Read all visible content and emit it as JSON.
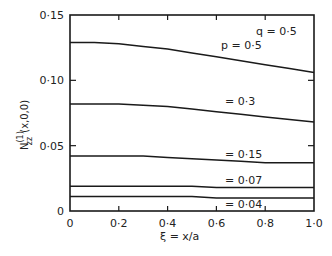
{
  "chart_data": {
    "type": "line",
    "title": "",
    "xlabel": "ξ = x/a",
    "ylabel": "N(1)zz (x,0,0)",
    "xlim": [
      0,
      1.0
    ],
    "ylim": [
      0,
      0.15
    ],
    "grid": false,
    "legend": "inline annotations",
    "x_ticks": [
      "0",
      "0·2",
      "0·4",
      "0·6",
      "0·8",
      "1·0"
    ],
    "y_ticks": [
      "0",
      "0·05",
      "0·10",
      "0·15"
    ],
    "annotations": [
      "q = 0·5",
      "p = 0·5",
      "= 0·3",
      "= 0·15",
      "= 0·07",
      "= 0·04"
    ],
    "x": [
      0,
      0.1,
      0.2,
      0.3,
      0.4,
      0.5,
      0.6,
      0.7,
      0.8,
      0.9,
      1.0
    ],
    "series": [
      {
        "name": "p = 0.5",
        "values": [
          0.129,
          0.129,
          0.128,
          0.126,
          0.124,
          0.121,
          0.118,
          0.115,
          0.112,
          0.109,
          0.106
        ]
      },
      {
        "name": "p = 0.3",
        "values": [
          0.082,
          0.082,
          0.082,
          0.081,
          0.08,
          0.078,
          0.076,
          0.074,
          0.072,
          0.07,
          0.068
        ]
      },
      {
        "name": "p = 0.15",
        "values": [
          0.042,
          0.042,
          0.042,
          0.042,
          0.041,
          0.04,
          0.039,
          0.038,
          0.037,
          0.037,
          0.037
        ]
      },
      {
        "name": "p = 0.07",
        "values": [
          0.019,
          0.019,
          0.019,
          0.019,
          0.019,
          0.019,
          0.018,
          0.018,
          0.018,
          0.018,
          0.018
        ]
      },
      {
        "name": "p = 0.04",
        "values": [
          0.011,
          0.011,
          0.011,
          0.011,
          0.011,
          0.011,
          0.01,
          0.01,
          0.01,
          0.01,
          0.01
        ]
      }
    ],
    "parameter_note": "q = 0.5"
  },
  "labels": {
    "q": "q = 0·5",
    "p05": "p = 0·5",
    "p03": "= 0·3",
    "p015": "= 0·15",
    "p007": "= 0·07",
    "p004": "= 0·04",
    "xlabel": "ξ = x/a",
    "ylabel_main": "N",
    "ylabel_sup": "(1)",
    "ylabel_sub": "zz",
    "ylabel_args": "(x,0,0)"
  }
}
